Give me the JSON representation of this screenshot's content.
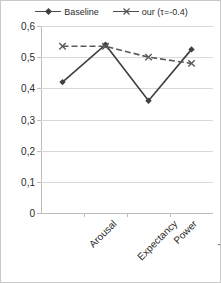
{
  "chart_data": {
    "type": "line",
    "title": "",
    "subtitle": "",
    "xlabel": "",
    "ylabel": "",
    "categories": [
      "Arousal",
      "Expectancy",
      "Power",
      "Valence"
    ],
    "series": [
      {
        "name": "Baseline",
        "values": [
          0.42,
          0.54,
          0.36,
          0.525
        ],
        "color": "#3f3f3f",
        "line_style": "solid",
        "marker": "diamond"
      },
      {
        "name": "our (τ=-0.4)",
        "values": [
          0.535,
          0.535,
          0.5,
          0.48
        ],
        "color": "#5a5a5a",
        "line_style": "dashed",
        "marker": "cross"
      }
    ],
    "ylim": [
      0,
      0.6
    ],
    "ytick_values": [
      0,
      0.1,
      0.2,
      0.3,
      0.4,
      0.5,
      0.6
    ],
    "ytick_labels": [
      "0",
      "0,1",
      "0,2",
      "0,3",
      "0,4",
      "0,5",
      "0,6"
    ],
    "grid": true,
    "grid_axis": "y",
    "legend_position": "top",
    "xtick_label_rotation": -45,
    "decimal_separator": ","
  },
  "legend": {
    "entries": [
      {
        "label": "Baseline",
        "marker_icon": "diamond-marker-icon"
      },
      {
        "label": "our (τ=-0.4)",
        "marker_icon": "cross-marker-icon"
      }
    ]
  },
  "colors": {
    "background": "#ffffff",
    "frame": "#c9c9c9",
    "gridline": "#d9d9d9",
    "axis": "#bdbdbd",
    "text": "#2b2b2b",
    "series_baseline": "#3f3f3f",
    "series_our": "#5a5a5a"
  }
}
